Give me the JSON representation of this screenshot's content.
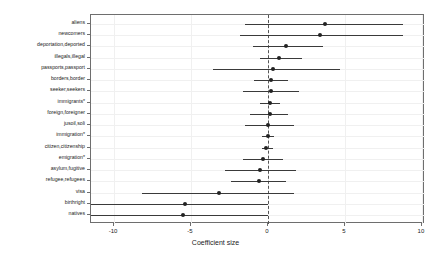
{
  "chart_data": {
    "type": "scatter",
    "title": "",
    "subtitle": "",
    "xlabel": "Coefficient size",
    "ylabel": "",
    "xlim": [
      -11.5,
      10.2
    ],
    "xticks": [
      -10,
      -5,
      0,
      10
    ],
    "xtick_labels": [
      "-10",
      "-5",
      "0",
      "5",
      "10"
    ],
    "xticks_all": [
      -10,
      -5,
      0,
      5,
      10
    ],
    "grid": true,
    "legend": null,
    "reference_line": 0,
    "reference_line_style": "dashed",
    "orientation": "horizontal",
    "point_color": "#222222",
    "line_color": "#3a3a3a",
    "grid_color": "#f0f0f0",
    "axis_color": "#6e6e6e",
    "categories": [
      "aliens",
      "newcomers",
      "deportation,deported",
      "illegals,illegal",
      "passports,passport",
      "borders,border",
      "seeker,seekers",
      "immigrants*",
      "foreign,foreigner",
      "jusoil,soli",
      "immigration*",
      "citizen,citizenship",
      "emigration*",
      "asylum,fugitive",
      "refugee,refugees",
      "visa",
      "birthright",
      "natives"
    ],
    "series": [
      {
        "name": "Coefficient size",
        "points": [
          {
            "category": "aliens",
            "value": 3.7,
            "low": -1.5,
            "high": 8.8
          },
          {
            "category": "newcomers",
            "value": 3.4,
            "low": -1.8,
            "high": 8.8
          },
          {
            "category": "deportation,deported",
            "value": 1.2,
            "low": -1.0,
            "high": 3.6
          },
          {
            "category": "illegals,illegal",
            "value": 0.7,
            "low": -0.5,
            "high": 2.2
          },
          {
            "category": "passports,passport",
            "value": 0.3,
            "low": -3.6,
            "high": 4.7
          },
          {
            "category": "borders,border",
            "value": 0.2,
            "low": -0.9,
            "high": 1.3
          },
          {
            "category": "seeker,seekers",
            "value": 0.2,
            "low": -1.6,
            "high": 2.0
          },
          {
            "category": "immigrants*",
            "value": 0.1,
            "low": -0.5,
            "high": 0.8
          },
          {
            "category": "foreign,foreigner",
            "value": 0.1,
            "low": -1.2,
            "high": 1.3
          },
          {
            "category": "jusoil,soli",
            "value": 0.0,
            "low": -1.5,
            "high": 1.7
          },
          {
            "category": "immigration*",
            "value": 0.0,
            "low": -0.4,
            "high": 0.4
          },
          {
            "category": "citizen,citizenship",
            "value": -0.1,
            "low": -0.4,
            "high": 0.3
          },
          {
            "category": "emigration*",
            "value": -0.3,
            "low": -1.6,
            "high": 1.0
          },
          {
            "category": "asylum,fugitive",
            "value": -0.5,
            "low": -2.8,
            "high": 1.8
          },
          {
            "category": "refugee,refugees",
            "value": -0.6,
            "low": -2.4,
            "high": 1.2
          },
          {
            "category": "visa",
            "value": -3.2,
            "low": -8.2,
            "high": 1.7
          },
          {
            "category": "birthright",
            "value": -5.4,
            "low": -11.5,
            "high": 0.0
          },
          {
            "category": "natives",
            "value": -5.5,
            "low": -11.5,
            "high": 0.0
          }
        ]
      }
    ]
  }
}
